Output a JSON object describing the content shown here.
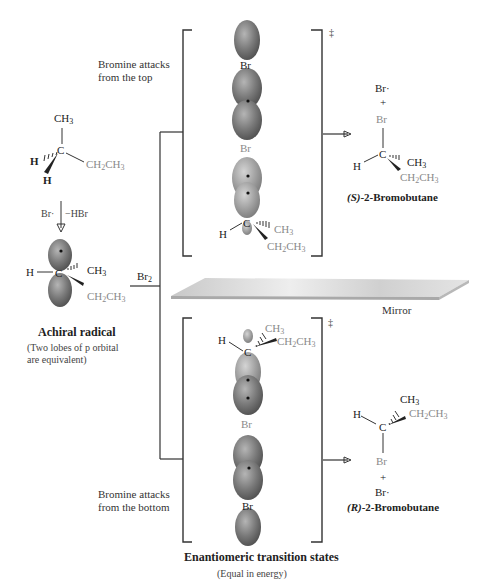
{
  "colors": {
    "orbital_dark": "#6e6e6e",
    "orbital_light": "#a8a8a8",
    "line": "#333333",
    "gray_text": "#8a8a8a",
    "mirror": "#d8d8d8"
  },
  "starting_material": {
    "ch3": "CH3",
    "c": "C",
    "ch2ch3": "CH2CH3",
    "h1": "H",
    "h2": "H"
  },
  "step1": {
    "reagent": "Br·",
    "byproduct": "−HBr"
  },
  "radical": {
    "h": "H",
    "c": "C",
    "ch3": "CH3",
    "ch2ch3": "CH2CH3",
    "title": "Achiral radical",
    "note_line1": "(Two lobes of p orbital",
    "note_line2": "are equivalent)"
  },
  "branch": {
    "reagent": "Br2"
  },
  "top_path": {
    "label_line1": "Bromine attacks",
    "label_line2": "from the top",
    "ts_br1": "Br",
    "ts_br2": "Br",
    "ts_c": "C",
    "ts_h": "H",
    "ts_ch3": "CH3",
    "ts_ch2ch3": "CH2CH3",
    "double_dagger": "‡"
  },
  "top_product": {
    "br_radical": "Br·",
    "plus": "+",
    "br": "Br",
    "c": "C",
    "h": "H",
    "ch3": "CH3",
    "ch2ch3": "CH2CH3",
    "name_prefix": "(S)",
    "name": "-2-Bromobutane"
  },
  "mirror": {
    "label": "Mirror"
  },
  "bottom_path": {
    "label_line1": "Bromine attacks",
    "label_line2": "from the bottom",
    "ts_h": "H",
    "ts_c": "C",
    "ts_ch3": "CH3",
    "ts_ch2ch3": "CH2CH3",
    "ts_br1": "Br",
    "ts_br2": "Br",
    "double_dagger": "‡"
  },
  "bottom_product": {
    "h": "H",
    "c": "C",
    "ch3": "CH3",
    "ch2ch3": "CH2CH3",
    "br": "Br",
    "plus": "+",
    "br_radical": "Br·",
    "name_prefix": "(R)",
    "name": "-2-Bromobutane"
  },
  "footer": {
    "title": "Enantiomeric transition states",
    "subtitle": "(Equal in energy)"
  }
}
